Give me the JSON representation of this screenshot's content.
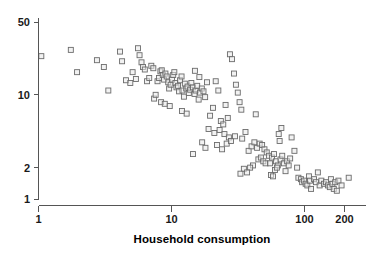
{
  "chart_data": {
    "type": "scatter",
    "title": "",
    "subtitle": "",
    "xlabel": "Household consumption",
    "ylabel": "",
    "xscale": "log",
    "yscale": "log",
    "xlim": [
      1,
      260
    ],
    "ylim": [
      0.85,
      55
    ],
    "xticks": [
      1,
      10,
      100,
      200
    ],
    "xticklabels": [
      "1",
      "10",
      "100",
      "200"
    ],
    "yticks": [
      1,
      2,
      10,
      50
    ],
    "yticklabels": [
      "1",
      "2",
      "10",
      "50"
    ],
    "grid": false,
    "legend": null,
    "marker": "open-square",
    "marker_color": "#6b6b6b",
    "marker_fill": "#e8e8e8",
    "n_points": 162,
    "points": [
      [
        1.05,
        23.5
      ],
      [
        1.75,
        27.0
      ],
      [
        1.95,
        16.5
      ],
      [
        2.75,
        21.5
      ],
      [
        3.1,
        18.5
      ],
      [
        3.35,
        11.0
      ],
      [
        4.1,
        26.0
      ],
      [
        4.25,
        21.0
      ],
      [
        4.55,
        13.8
      ],
      [
        4.9,
        13.0
      ],
      [
        5.1,
        16.5
      ],
      [
        5.4,
        14.2
      ],
      [
        5.6,
        28.0
      ],
      [
        5.75,
        24.0
      ],
      [
        5.95,
        20.5
      ],
      [
        6.1,
        18.5
      ],
      [
        6.3,
        17.5
      ],
      [
        6.55,
        13.5
      ],
      [
        6.8,
        14.5
      ],
      [
        7.05,
        19.0
      ],
      [
        7.3,
        18.0
      ],
      [
        7.4,
        9.2
      ],
      [
        7.6,
        10.0
      ],
      [
        7.85,
        13.5
      ],
      [
        8.05,
        14.5
      ],
      [
        8.25,
        16.8
      ],
      [
        8.45,
        17.2
      ],
      [
        8.6,
        15.5
      ],
      [
        8.8,
        14.0
      ],
      [
        9.0,
        16.0
      ],
      [
        9.2,
        15.0
      ],
      [
        9.45,
        13.2
      ],
      [
        9.6,
        11.5
      ],
      [
        9.85,
        12.5
      ],
      [
        10.1,
        14.0
      ],
      [
        10.3,
        15.5
      ],
      [
        10.5,
        16.5
      ],
      [
        10.7,
        13.0
      ],
      [
        10.9,
        11.8
      ],
      [
        11.2,
        12.2
      ],
      [
        11.4,
        10.8
      ],
      [
        11.6,
        13.8
      ],
      [
        11.9,
        15.0
      ],
      [
        12.1,
        11.0
      ],
      [
        12.4,
        9.6
      ],
      [
        12.6,
        12.8
      ],
      [
        12.9,
        11.5
      ],
      [
        13.2,
        12.0
      ],
      [
        13.5,
        10.4
      ],
      [
        13.8,
        11.2
      ],
      [
        14.1,
        13.0
      ],
      [
        14.5,
        11.8
      ],
      [
        14.9,
        10.2
      ],
      [
        15.2,
        11.0
      ],
      [
        15.6,
        12.2
      ],
      [
        16.0,
        9.0
      ],
      [
        16.4,
        10.5
      ],
      [
        16.9,
        11.5
      ],
      [
        17.4,
        10.8
      ],
      [
        17.9,
        9.5
      ],
      [
        8.35,
        8.5
      ],
      [
        8.9,
        8.2
      ],
      [
        9.7,
        7.8
      ],
      [
        12.0,
        7.0
      ],
      [
        13.0,
        6.6
      ],
      [
        15.0,
        17.0
      ],
      [
        16.2,
        14.8
      ],
      [
        18.5,
        13.2
      ],
      [
        19.5,
        6.3
      ],
      [
        20.5,
        7.5
      ],
      [
        21.5,
        13.5
      ],
      [
        22.5,
        11.0
      ],
      [
        23.5,
        5.6
      ],
      [
        24.5,
        5.2
      ],
      [
        25.5,
        8.0
      ],
      [
        26.5,
        6.0
      ],
      [
        27.5,
        24.5
      ],
      [
        28.5,
        22.0
      ],
      [
        29.5,
        16.0
      ],
      [
        30.5,
        12.5
      ],
      [
        31.5,
        10.5
      ],
      [
        32.5,
        8.5
      ],
      [
        33.5,
        7.2
      ],
      [
        19.0,
        4.7
      ],
      [
        21.0,
        4.3
      ],
      [
        23.0,
        4.6
      ],
      [
        25.0,
        4.2
      ],
      [
        27.0,
        3.9
      ],
      [
        17.0,
        3.5
      ],
      [
        14.5,
        2.7
      ],
      [
        18.0,
        3.1
      ],
      [
        22.0,
        3.3
      ],
      [
        24.0,
        3.0
      ],
      [
        26.0,
        3.4
      ],
      [
        28.0,
        3.6
      ],
      [
        30.0,
        4.0
      ],
      [
        34.0,
        3.8
      ],
      [
        36.0,
        4.4
      ],
      [
        38.0,
        2.9
      ],
      [
        40.0,
        3.2
      ],
      [
        42.0,
        3.5
      ],
      [
        44.0,
        3.1
      ],
      [
        46.0,
        3.4
      ],
      [
        48.0,
        3.3
      ],
      [
        50.0,
        3.0
      ],
      [
        52.0,
        2.8
      ],
      [
        54.0,
        2.6
      ],
      [
        45.0,
        2.4
      ],
      [
        47.0,
        2.5
      ],
      [
        49.0,
        2.3
      ],
      [
        51.0,
        2.2
      ],
      [
        41.0,
        2.1
      ],
      [
        39.0,
        2.0
      ],
      [
        55.0,
        2.2
      ],
      [
        57.0,
        2.5
      ],
      [
        59.0,
        2.7
      ],
      [
        61.0,
        2.3
      ],
      [
        63.0,
        2.1
      ],
      [
        65.0,
        3.6
      ],
      [
        43.0,
        6.5
      ],
      [
        35.0,
        1.95
      ],
      [
        37.0,
        1.8
      ],
      [
        33.0,
        1.75
      ],
      [
        56.0,
        1.7
      ],
      [
        58.0,
        1.65
      ],
      [
        60.0,
        1.9
      ],
      [
        62.0,
        2.0
      ],
      [
        66.0,
        2.4
      ],
      [
        68.0,
        2.6
      ],
      [
        70.0,
        2.2
      ],
      [
        72.0,
        1.85
      ],
      [
        74.0,
        2.3
      ],
      [
        76.0,
        2.1
      ],
      [
        78.0,
        2.45
      ],
      [
        64.0,
        4.2
      ],
      [
        67.0,
        4.8
      ],
      [
        80.0,
        3.9
      ],
      [
        84.0,
        2.9
      ],
      [
        88.0,
        2.0
      ],
      [
        90.0,
        1.6
      ],
      [
        94.0,
        1.55
      ],
      [
        96.0,
        1.45
      ],
      [
        99.0,
        1.5
      ],
      [
        102.0,
        1.4
      ],
      [
        105.0,
        1.35
      ],
      [
        108.0,
        1.65
      ],
      [
        110.0,
        1.5
      ],
      [
        112.0,
        1.25
      ],
      [
        118.0,
        1.55
      ],
      [
        122.0,
        1.45
      ],
      [
        126.0,
        1.8
      ],
      [
        130.0,
        1.35
      ],
      [
        134.0,
        1.5
      ],
      [
        140.0,
        1.4
      ],
      [
        145.0,
        1.45
      ],
      [
        150.0,
        1.35
      ],
      [
        155.0,
        1.3
      ],
      [
        158.0,
        1.55
      ],
      [
        162.0,
        1.4
      ],
      [
        166.0,
        1.25
      ],
      [
        170.0,
        1.45
      ],
      [
        175.0,
        1.2
      ],
      [
        180.0,
        1.5
      ],
      [
        190.0,
        1.35
      ],
      [
        215.0,
        1.6
      ]
    ]
  }
}
